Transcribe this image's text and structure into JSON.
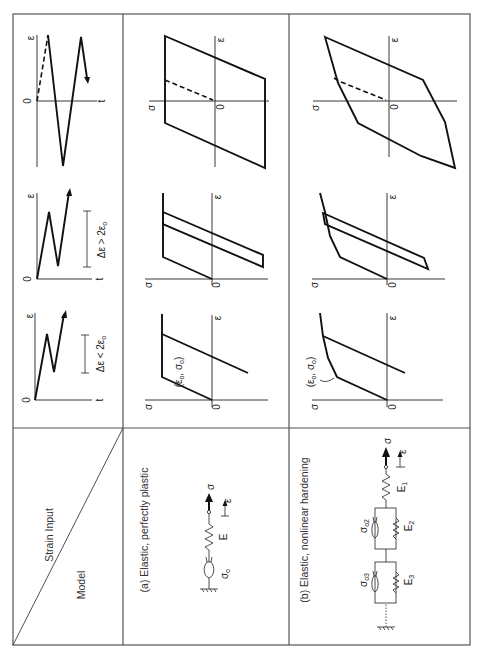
{
  "header": {
    "strain_input_label": "Strain Input",
    "model_label": "Model"
  },
  "models": [
    {
      "title": "(a) Elastic, perfectly plastic",
      "stress_symbol": "σ",
      "strain_symbol": "ε",
      "spring_label": "E",
      "slider_label": "σ",
      "slider_sub": "o"
    },
    {
      "title": "(b) Elastic, nonlinear hardening",
      "stress_symbol": "σ",
      "strain_symbol": "ε",
      "spring1_label": "E",
      "spring1_sub": "1",
      "spring2_label": "E",
      "spring2_sub": "2",
      "spring3_label": "E",
      "spring3_sub": "3",
      "slider2_label": "σ",
      "slider2_sub": "o2",
      "slider3_label": "σ",
      "slider3_sub": "o3"
    }
  ],
  "strain_inputs": [
    {
      "id": "cyclic",
      "axis_origin": "0",
      "axis_x": "t",
      "axis_y": "ε",
      "range_label": ""
    },
    {
      "id": "large-range",
      "axis_origin": "0",
      "axis_x": "t",
      "axis_y": "ε",
      "range_label": "Δε > 2ε",
      "range_sub": "o"
    },
    {
      "id": "small-range",
      "axis_origin": "0",
      "axis_x": "t",
      "axis_y": "ε",
      "range_label": "Δε < 2ε",
      "range_sub": "o"
    }
  ],
  "response_axes": {
    "origin": "0",
    "x": "ε",
    "y": "σ"
  },
  "yield_point_label": "(ε",
  "yield_point_sub1": "o",
  "yield_point_mid": ", σ",
  "yield_point_sub2": "o",
  "yield_point_end": ")",
  "colors": {
    "line": "#111111",
    "frame": "#555555",
    "background": "#ffffff"
  }
}
